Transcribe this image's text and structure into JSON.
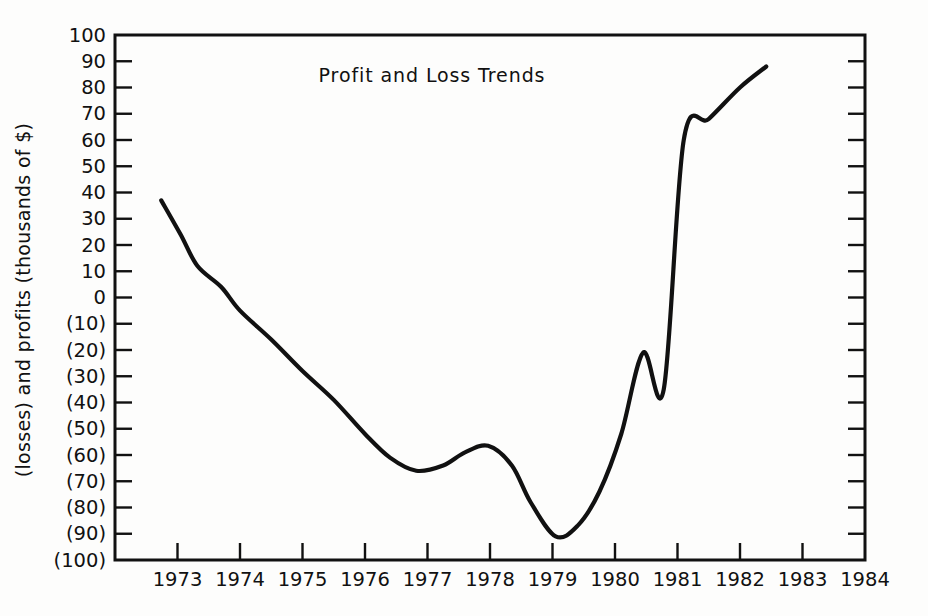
{
  "chart_data": {
    "type": "line",
    "title": "Profit and Loss Trends",
    "xlabel": "",
    "ylabel": "(losses) and profits (thousands of $)",
    "xlim": [
      1972,
      1984
    ],
    "ylim": [
      -100,
      100
    ],
    "grid": false,
    "legend": "none",
    "x_tick_labels": [
      "1973",
      "1974",
      "1975",
      "1976",
      "1977",
      "1978",
      "1979",
      "1980",
      "1981",
      "1982",
      "1983",
      "1984"
    ],
    "x_tick_values": [
      1973,
      1974,
      1975,
      1976,
      1977,
      1978,
      1979,
      1980,
      1981,
      1982,
      1983,
      1984
    ],
    "y_tick_labels": [
      "100",
      "90",
      "80",
      "70",
      "60",
      "50",
      "40",
      "30",
      "20",
      "10",
      "0",
      "(10)",
      "(20)",
      "(30)",
      "(40)",
      "(50)",
      "(60)",
      "(70)",
      "(80)",
      "(90)",
      "(100)"
    ],
    "y_tick_values": [
      100,
      90,
      80,
      70,
      60,
      50,
      40,
      30,
      20,
      10,
      0,
      -10,
      -20,
      -30,
      -40,
      -50,
      -60,
      -70,
      -80,
      -90,
      -100
    ],
    "series": [
      {
        "name": "Profit and Loss",
        "color": "#111111",
        "x": [
          1972.74,
          1973.05,
          1973.32,
          1973.7,
          1974.0,
          1974.5,
          1975.0,
          1975.5,
          1976.0,
          1976.4,
          1976.82,
          1977.25,
          1977.6,
          1977.97,
          1978.35,
          1978.65,
          1979.05,
          1979.4,
          1979.75,
          1980.1,
          1980.45,
          1980.78,
          1981.1,
          1981.5,
          1982.0,
          1982.42
        ],
        "y": [
          37,
          24,
          12,
          4,
          -5,
          -16,
          -28,
          -39,
          -52,
          -61,
          -66,
          -64,
          -59,
          -56.5,
          -64,
          -78,
          -91,
          -87,
          -74,
          -52,
          -21,
          -35,
          60,
          68,
          80,
          88
        ]
      }
    ],
    "notable_points": {
      "start": {
        "x": 1972.74,
        "y": 37
      },
      "break_even": {
        "x": 1974.0,
        "y": 0
      },
      "first_trough": {
        "x": 1976.82,
        "y": -66
      },
      "local_peak": {
        "x": 1977.97,
        "y": -56
      },
      "global_min": {
        "x": 1979.05,
        "y": -91
      },
      "recovery_knee": {
        "x": 1980.78,
        "y": 35
      },
      "end": {
        "x": 1982.42,
        "y": 88
      }
    }
  }
}
